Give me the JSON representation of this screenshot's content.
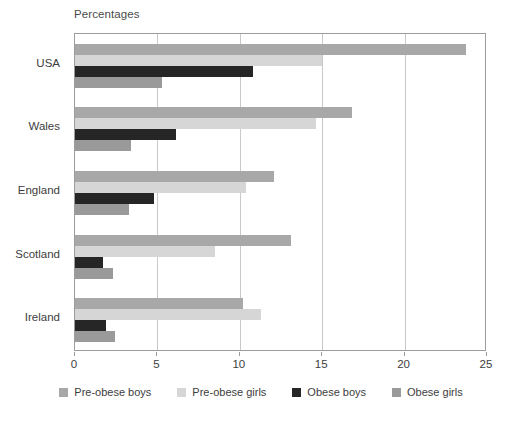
{
  "chart_data": {
    "type": "bar",
    "orientation": "horizontal",
    "title": "",
    "axis_title": "Percentages",
    "xlabel": "",
    "ylabel": "",
    "xlim": [
      0,
      25
    ],
    "xticks": [
      0,
      5,
      10,
      15,
      20,
      25
    ],
    "grid": true,
    "grid_axis": "x",
    "legend_position": "bottom",
    "categories": [
      "USA",
      "Wales",
      "England",
      "Scotland",
      "Ireland"
    ],
    "series": [
      {
        "name": "Pre-obese boys",
        "color": "#a8a8a8",
        "values": [
          23.7,
          16.8,
          12.1,
          13.1,
          10.2
        ]
      },
      {
        "name": "Pre-obese girls",
        "color": "#d6d6d6",
        "values": [
          15.0,
          14.6,
          10.4,
          8.5,
          11.3
        ]
      },
      {
        "name": "Obese boys",
        "color": "#262626",
        "values": [
          10.8,
          6.1,
          4.8,
          1.7,
          1.9
        ]
      },
      {
        "name": "Obese girls",
        "color": "#9a9a9a",
        "values": [
          5.3,
          3.4,
          3.3,
          2.3,
          2.4
        ]
      }
    ]
  },
  "legend": {
    "items": [
      {
        "label": "Pre-obese boys",
        "color": "#a8a8a8"
      },
      {
        "label": "Pre-obese girls",
        "color": "#d6d6d6"
      },
      {
        "label": "Obese boys",
        "color": "#262626"
      },
      {
        "label": "Obese girls",
        "color": "#9a9a9a"
      }
    ]
  },
  "colors": {
    "frame": "#9c9c9c",
    "grid": "#c9c9c9",
    "text": "#3d3d3d",
    "background": "#ffffff"
  }
}
